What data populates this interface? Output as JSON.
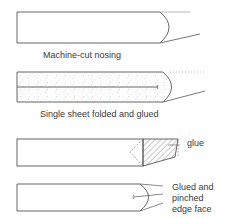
{
  "figures": [
    {
      "id": "machine-cut",
      "caption": "Machine-cut nosing"
    },
    {
      "id": "folded-glued",
      "caption": "Single sheet folded and glued"
    },
    {
      "id": "glued-wedge",
      "callout": "glue"
    },
    {
      "id": "glued-pinched",
      "callout": "Glued and\npinched\nedge face"
    }
  ],
  "colors": {
    "line": "#555555",
    "hatch": "#777777",
    "stipple": "#999999",
    "text": "#3a3a3a"
  }
}
